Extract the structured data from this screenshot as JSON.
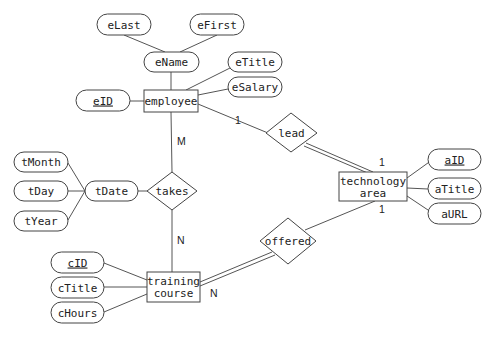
{
  "diagram": {
    "type": "entity-relationship",
    "entities": {
      "employee": {
        "label": "employee"
      },
      "technology_area": {
        "label_line1": "technology",
        "label_line2": "area"
      },
      "training_course": {
        "label_line1": "training",
        "label_line2": "course"
      }
    },
    "relationships": {
      "lead": {
        "label": "lead"
      },
      "takes": {
        "label": "takes"
      },
      "offered": {
        "label": "offered"
      }
    },
    "attributes": {
      "eLast": {
        "label": "eLast"
      },
      "eFirst": {
        "label": "eFirst"
      },
      "eName": {
        "label": "eName"
      },
      "eTitle": {
        "label": "eTitle"
      },
      "eSalary": {
        "label": "eSalary"
      },
      "eID": {
        "label": "eID",
        "key": true
      },
      "tMonth": {
        "label": "tMonth"
      },
      "tDay": {
        "label": "tDay"
      },
      "tYear": {
        "label": "tYear"
      },
      "tDate": {
        "label": "tDate"
      },
      "aID": {
        "label": "aID",
        "key": true
      },
      "aTitle": {
        "label": "aTitle"
      },
      "aURL": {
        "label": "aURL"
      },
      "cID": {
        "label": "cID",
        "key": true
      },
      "cTitle": {
        "label": "cTitle"
      },
      "cHours": {
        "label": "cHours"
      }
    },
    "cardinalities": {
      "employee_lead": "1",
      "lead_technology": "1",
      "offered_technology": "1",
      "employee_takes": "M",
      "takes_training": "N",
      "offered_training": "N"
    },
    "colors": {
      "stroke": "#444444",
      "text": "#222222",
      "background": "#ffffff"
    }
  }
}
